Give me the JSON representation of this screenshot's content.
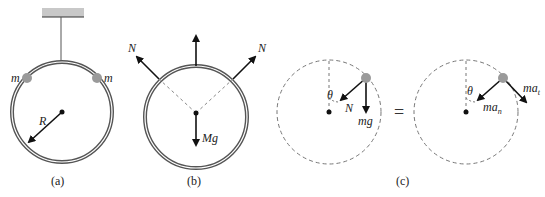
{
  "figures": {
    "a": {
      "caption": "(a)",
      "labels": {
        "mass_left": "m",
        "mass_right": "m",
        "radius": "R"
      }
    },
    "b": {
      "caption": "(b)",
      "labels": {
        "normal_left": "N",
        "normal_right": "N",
        "weight": "Mg"
      }
    },
    "c": {
      "caption": "(c)",
      "equals": "=",
      "left": {
        "angle": "θ",
        "normal": "N",
        "weight": "mg"
      },
      "right": {
        "angle": "θ",
        "normal_accel": "ma",
        "normal_sub": "n",
        "tangential_accel": "ma",
        "tangential_sub": "t"
      }
    }
  },
  "colors": {
    "ring": "#555555",
    "bead": "#9a9a9a",
    "arrow": "#111111",
    "dash": "#777777",
    "ceiling": "#bdbdbd"
  }
}
